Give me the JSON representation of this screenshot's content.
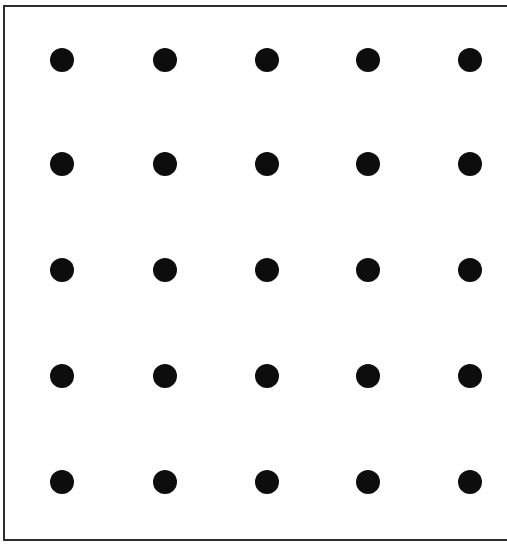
{
  "diagram": {
    "type": "dot-grid",
    "rows": 5,
    "columns": 5,
    "dot_color": "#0d0d0d",
    "border_color": "#2e2e2e",
    "background_color": "#ffffff",
    "column_centers_px": [
      62,
      165,
      267,
      368,
      470
    ],
    "row_centers_px": [
      60,
      164,
      270,
      376,
      482
    ],
    "dot_diameter_px": 24
  }
}
